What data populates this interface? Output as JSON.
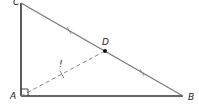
{
  "diagram": {
    "type": "right-triangle",
    "points": {
      "C": {
        "label": "C"
      },
      "A": {
        "label": "A"
      },
      "B": {
        "label": "B"
      },
      "D": {
        "label": "D"
      }
    },
    "segment_annotation": "!",
    "colors": {
      "stroke": "#333333",
      "hypotenuse": "#777777",
      "dashed": "#888888",
      "point": "#111111"
    }
  }
}
